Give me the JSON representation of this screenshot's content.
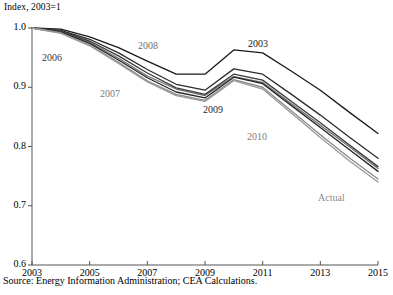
{
  "chart_data": {
    "type": "line",
    "title": "",
    "ylabel": "Index, 2003=1",
    "xlabel": "",
    "xlim": [
      2003,
      2015
    ],
    "ylim": [
      0.6,
      1.0
    ],
    "grid": false,
    "legend_position": "inline-annotations",
    "yticks": [
      "1.0",
      "0.9",
      "0.8",
      "0.7",
      "0.6"
    ],
    "ytick_values": [
      1.0,
      0.9,
      0.8,
      0.7,
      0.6
    ],
    "xticks": [
      "2003",
      "2005",
      "2007",
      "2009",
      "2011",
      "2013",
      "2015"
    ],
    "xtick_values": [
      2003,
      2005,
      2007,
      2009,
      2011,
      2013,
      2015
    ],
    "x": [
      2003,
      2004,
      2005,
      2006,
      2007,
      2008,
      2009,
      2010,
      2011,
      2012,
      2013,
      2014,
      2015
    ],
    "series": [
      {
        "name": "2003",
        "color": "#1a1a1a",
        "values": [
          1.0,
          0.998,
          0.985,
          0.967,
          0.944,
          0.922,
          0.922,
          0.963,
          0.958,
          0.927,
          0.895,
          0.858,
          0.822
        ],
        "annotation": "2003"
      },
      {
        "name": "2006",
        "color": "#2b2b2b",
        "values": [
          1.0,
          0.996,
          0.981,
          0.958,
          0.93,
          0.905,
          0.895,
          0.931,
          0.922,
          0.888,
          0.853,
          0.816,
          0.78
        ],
        "annotation": "2006"
      },
      {
        "name": "2007",
        "color": "#6e6e6e",
        "values": [
          1.0,
          0.994,
          0.976,
          0.949,
          0.919,
          0.897,
          0.886,
          0.918,
          0.908,
          0.872,
          0.836,
          0.8,
          0.763
        ],
        "annotation": "2007"
      },
      {
        "name": "2008",
        "color": "#3a3a3a",
        "values": [
          1.0,
          0.995,
          0.978,
          0.953,
          0.924,
          0.899,
          0.888,
          0.922,
          0.912,
          0.876,
          0.84,
          0.803,
          0.766
        ],
        "annotation": "2008"
      },
      {
        "name": "2009",
        "color": "#242424",
        "values": [
          1.0,
          0.993,
          0.974,
          0.946,
          0.916,
          0.892,
          0.882,
          0.917,
          0.906,
          0.869,
          0.832,
          0.795,
          0.758
        ],
        "annotation": "2009"
      },
      {
        "name": "2010",
        "color": "#8a8a8a",
        "values": [
          1.0,
          0.992,
          0.971,
          0.942,
          0.911,
          0.888,
          0.878,
          0.913,
          0.9,
          0.86,
          0.82,
          0.781,
          0.745
        ],
        "annotation": "2010"
      },
      {
        "name": "Actual",
        "color": "#9a9a9a",
        "values": [
          1.0,
          0.991,
          0.97,
          0.94,
          0.909,
          0.886,
          0.876,
          0.911,
          0.897,
          0.856,
          0.815,
          0.776,
          0.74
        ],
        "annotation": "Actual"
      }
    ],
    "annotations": [
      {
        "text": "2006",
        "x_px": 42,
        "y_px": 52,
        "color": "#3a3a3a"
      },
      {
        "text": "2007",
        "x_px": 100,
        "y_px": 88,
        "color": "#7a7a7a"
      },
      {
        "text": "2008",
        "x_px": 138,
        "y_px": 40,
        "color": "#6e6e6e"
      },
      {
        "text": "2003",
        "x_px": 248,
        "y_px": 38,
        "color": "#1a1a1a"
      },
      {
        "text": "2009",
        "x_px": 203,
        "y_px": 104,
        "color": "#2b2b2b"
      },
      {
        "text": "2010",
        "x_px": 247,
        "y_px": 131,
        "color": "#7a7a7a"
      },
      {
        "text": "Actual",
        "x_px": 318,
        "y_px": 192,
        "color": "#8a8a8a"
      }
    ],
    "source_note": "Source: Energy Information Administration; CEA Calculations."
  }
}
